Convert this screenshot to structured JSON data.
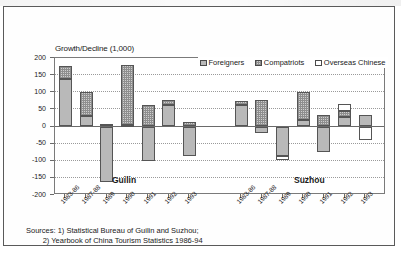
{
  "figure": {
    "ytitle": "Growth/Decline (1,000)",
    "group_labels": [
      "Guilin",
      "Suzhou"
    ],
    "sources_line1": "Sources: 1) Statistical Bureau of Guilin and Suzhou;",
    "sources_line2": "        2) Yearbook of China Tourism Statistics 1986-94"
  },
  "legend": {
    "items": [
      {
        "label": "Foreigners",
        "swatch": "gray-solid"
      },
      {
        "label": "Compatriots",
        "swatch": "gray-checker"
      },
      {
        "label": "Overseas Chinese",
        "swatch": "white"
      }
    ]
  },
  "chart_data": {
    "type": "bar",
    "title": "",
    "subtitle": "",
    "xlabel": "",
    "ylabel": "Growth/Decline (1,000)",
    "ylim": [
      -200,
      200
    ],
    "yticks": [
      200,
      150,
      100,
      50,
      0,
      -50,
      -100,
      -150,
      -200
    ],
    "ytick_labels": [
      "200",
      "150",
      "100",
      "50",
      "0",
      "-50",
      "-100",
      "-150",
      "-200"
    ],
    "grid": true,
    "stacked": true,
    "legend_position": "top-right",
    "groups": [
      "Guilin",
      "Suzhou"
    ],
    "categories": [
      "1983-86",
      "1987-88",
      "1989",
      "1990",
      "1991",
      "1992",
      "1993"
    ],
    "series": [
      {
        "name": "Foreigners",
        "color": "#b9b9b9"
      },
      {
        "name": "Compatriots",
        "color": "#cfcfcf"
      },
      {
        "name": "Overseas Chinese",
        "color": "#ffffff"
      }
    ],
    "data": {
      "Guilin": {
        "1983-86": {
          "Foreigners": 138,
          "Compatriots": 38,
          "Overseas Chinese": 0
        },
        "1987-88": {
          "Foreigners": 32,
          "Compatriots": 70,
          "Overseas Chinese": 0
        },
        "1989": {
          "Foreigners": -163,
          "Compatriots": 0,
          "Overseas Chinese": 8
        },
        "1990": {
          "Foreigners": 5,
          "Compatriots": 175,
          "Overseas Chinese": 0
        },
        "1991": {
          "Foreigners": -102,
          "Compatriots": 62,
          "Overseas Chinese": 0
        },
        "1992": {
          "Foreigners": 62,
          "Compatriots": 16,
          "Overseas Chinese": 0
        },
        "1993": {
          "Foreigners": -86,
          "Compatriots": 14,
          "Overseas Chinese": 0
        }
      },
      "Suzhou": {
        "1983-86": {
          "Foreigners": 62,
          "Compatriots": 12,
          "Overseas Chinese": 0
        },
        "1987-88": {
          "Foreigners": -20,
          "Compatriots": 78,
          "Overseas Chinese": 0
        },
        "1989": {
          "Foreigners": -86,
          "Compatriots": 0,
          "Overseas Chinese": -12
        },
        "1990": {
          "Foreigners": 19,
          "Compatriots": 81,
          "Overseas Chinese": 0
        },
        "1991": {
          "Foreigners": -74,
          "Compatriots": 35,
          "Overseas Chinese": 0
        },
        "1992": {
          "Foreigners": 28,
          "Compatriots": 18,
          "Overseas Chinese": 21
        },
        "1993": {
          "Foreigners": 35,
          "Compatriots": 0,
          "Overseas Chinese": -40
        }
      }
    }
  }
}
